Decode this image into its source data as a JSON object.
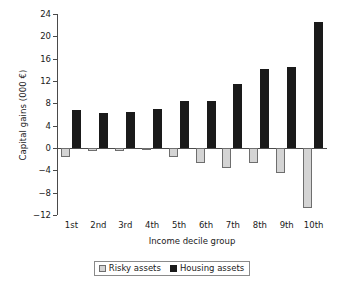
{
  "chart_data": {
    "type": "bar",
    "title": "",
    "subtitle": "",
    "xlabel": "Income decile group",
    "ylabel": "Capital gains (000 €)",
    "categories": [
      "1st",
      "2nd",
      "3rd",
      "4th",
      "5th",
      "6th",
      "7th",
      "8th",
      "9th",
      "10th"
    ],
    "series": [
      {
        "name": "Risky assets",
        "color": "#d4d4d4",
        "values": [
          -1.6,
          -0.5,
          -0.5,
          -0.4,
          -1.7,
          -2.6,
          -3.6,
          -2.6,
          -4.4,
          -10.7
        ]
      },
      {
        "name": "Housing assets",
        "color": "#1a1a1a",
        "values": [
          6.8,
          6.2,
          6.5,
          7.0,
          8.5,
          8.4,
          11.5,
          14.2,
          14.5,
          22.5
        ]
      }
    ],
    "ylim": [
      -12,
      24
    ],
    "yticks": [
      24,
      20,
      16,
      12,
      8,
      4,
      0,
      -4,
      -8,
      -12
    ],
    "ytick_labels": [
      "24",
      "20",
      "16",
      "12",
      "8",
      "4",
      "0",
      "−4",
      "−8",
      "−12"
    ],
    "grid": false,
    "legend_position": "bottom",
    "legend": [
      "Risky assets",
      "Housing assets"
    ]
  }
}
